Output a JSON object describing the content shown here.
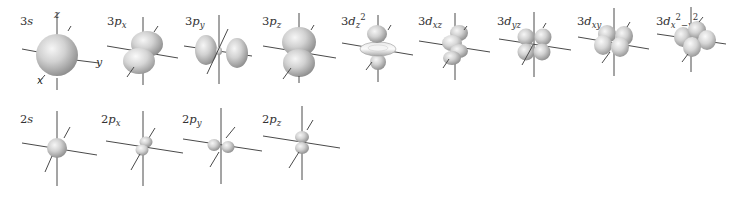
{
  "figure": {
    "colors": {
      "lobe_light": "#f2f2f2",
      "lobe_mid": "#c4c4c4",
      "lobe_dark": "#8e8e8e",
      "axis": "#4a4a4a",
      "text": "#333333"
    },
    "axis_labels": {
      "x": "x",
      "y": "y",
      "z": "z"
    },
    "rows": [
      {
        "name": "n3",
        "orbitals": [
          {
            "id": "3s",
            "n": "3",
            "l": "s",
            "sub": "",
            "sup": "",
            "cx": 57,
            "cy": 57,
            "scale": 1.0,
            "shape": "s"
          },
          {
            "id": "3px",
            "n": "3",
            "l": "p",
            "sub": "x",
            "sup": "",
            "cx": 143,
            "cy": 57,
            "scale": 1.0,
            "shape": "px"
          },
          {
            "id": "3py",
            "n": "3",
            "l": "p",
            "sub": "y",
            "sup": "",
            "cx": 219,
            "cy": 57,
            "scale": 1.0,
            "shape": "py"
          },
          {
            "id": "3pz",
            "n": "3",
            "l": "p",
            "sub": "z",
            "sup": "",
            "cx": 300,
            "cy": 55,
            "scale": 1.0,
            "shape": "pz"
          },
          {
            "id": "3dz2",
            "n": "3",
            "l": "d",
            "sub": "z",
            "sup": "2",
            "cx": 378,
            "cy": 50,
            "scale": 1.0,
            "shape": "dz2"
          },
          {
            "id": "3dxz",
            "n": "3",
            "l": "d",
            "sub": "xz",
            "sup": "",
            "cx": 455,
            "cy": 50,
            "scale": 1.0,
            "shape": "dxz"
          },
          {
            "id": "3dyz",
            "n": "3",
            "l": "d",
            "sub": "yz",
            "sup": "",
            "cx": 534,
            "cy": 44,
            "scale": 1.0,
            "shape": "dyz"
          },
          {
            "id": "3dxy",
            "n": "3",
            "l": "d",
            "sub": "xy",
            "sup": "",
            "cx": 614,
            "cy": 42,
            "scale": 1.0,
            "shape": "dxy"
          },
          {
            "id": "3dx2y2",
            "n": "3",
            "l": "d",
            "sub": "x2-y2",
            "sup": "",
            "cx": 691,
            "cy": 40,
            "scale": 1.0,
            "shape": "dx2y2"
          }
        ]
      },
      {
        "name": "n2",
        "orbitals": [
          {
            "id": "2s",
            "n": "2",
            "l": "s",
            "sub": "",
            "sup": "",
            "cx": 57,
            "cy": 148,
            "scale": 1.0,
            "shape": "s2"
          },
          {
            "id": "2px",
            "n": "2",
            "l": "p",
            "sub": "x",
            "sup": "",
            "cx": 143,
            "cy": 147,
            "scale": 1.0,
            "shape": "px2"
          },
          {
            "id": "2py",
            "n": "2",
            "l": "p",
            "sub": "y",
            "sup": "",
            "cx": 221,
            "cy": 145,
            "scale": 1.0,
            "shape": "py2"
          },
          {
            "id": "2pz",
            "n": "2",
            "l": "p",
            "sub": "z",
            "sup": "",
            "cx": 300,
            "cy": 138,
            "scale": 1.0,
            "shape": "pz2"
          }
        ]
      }
    ],
    "labels": [
      {
        "id": "3s",
        "x": 20,
        "y": 25,
        "main": "3s",
        "sub": "",
        "sup": ""
      },
      {
        "id": "3px",
        "x": 107,
        "y": 25,
        "main": "3p",
        "sub": "x",
        "sup": ""
      },
      {
        "id": "3py",
        "x": 185,
        "y": 25,
        "main": "3p",
        "sub": "y",
        "sup": ""
      },
      {
        "id": "3pz",
        "x": 262,
        "y": 25,
        "main": "3p",
        "sub": "z",
        "sup": ""
      },
      {
        "id": "3dz2",
        "x": 341,
        "y": 25,
        "main": "3d",
        "sub": "z",
        "sup": "2"
      },
      {
        "id": "3dxz",
        "x": 418,
        "y": 25,
        "main": "3d",
        "sub": "xz",
        "sup": ""
      },
      {
        "id": "3dyz",
        "x": 497,
        "y": 25,
        "main": "3d",
        "sub": "yz",
        "sup": ""
      },
      {
        "id": "3dxy",
        "x": 577,
        "y": 25,
        "main": "3d",
        "sub": "xy",
        "sup": ""
      },
      {
        "id": "3dx2y2",
        "x": 656,
        "y": 25,
        "main": "3d",
        "sub": "x",
        "sup": "2",
        "tail_sub": "−y",
        "tail_sup": "2"
      },
      {
        "id": "2s",
        "x": 20,
        "y": 123,
        "main": "2s",
        "sub": "",
        "sup": ""
      },
      {
        "id": "2px",
        "x": 101,
        "y": 123,
        "main": "2p",
        "sub": "x",
        "sup": ""
      },
      {
        "id": "2py",
        "x": 182,
        "y": 123,
        "main": "2p",
        "sub": "y",
        "sup": ""
      },
      {
        "id": "2pz",
        "x": 262,
        "y": 123,
        "main": "2p",
        "sub": "z",
        "sup": ""
      }
    ]
  }
}
